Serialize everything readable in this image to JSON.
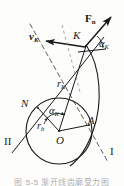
{
  "figure": {
    "background_color": "#fdfdfc",
    "ink_color": "#1a1a1a",
    "width": 124,
    "height": 186
  },
  "labels": {
    "force_normal": "F",
    "force_normal_sub": "n",
    "velocity": "v",
    "velocity_sub": "K",
    "point_k": "K",
    "point_n": "N",
    "point_a": "A",
    "center_o": "O",
    "radius_k": "r",
    "radius_k_sub": "K",
    "radius_base": "r",
    "radius_base_sub": "b",
    "angle_top": "α",
    "angle_top_sub": "K",
    "angle_inner": "α",
    "angle_inner_sub": "K",
    "line_one": "I",
    "line_two": "II"
  },
  "caption": {
    "text": "图 5-5 渐开线齿廓受力图"
  },
  "geometry": {
    "base_circle": {
      "cx": 59,
      "cy": 131,
      "r": 33
    },
    "point_k": {
      "x": 86,
      "y": 46
    },
    "point_n": {
      "x": 38,
      "y": 108
    },
    "point_a": {
      "x": 88,
      "y": 126
    },
    "point_o": {
      "x": 59,
      "y": 131
    },
    "involute_arc": {
      "start_x": 86,
      "start_y": 46,
      "end_x": 72,
      "end_y": 164
    },
    "line_I": {
      "x1": 30,
      "y1": 24,
      "x2": 108,
      "y2": 160,
      "style": "dashed"
    },
    "line_II": {
      "x1": 14,
      "y1": 150,
      "x2": 103,
      "y2": 38,
      "style": "solid"
    },
    "force_arrow": {
      "x1": 86,
      "y1": 46,
      "x2": 112,
      "y2": 16
    },
    "velocity_arrow": {
      "x1": 86,
      "y1": 46,
      "x2": 45,
      "y2": 41
    },
    "angle_top_deg": 22,
    "angle_inner_deg": 24
  }
}
